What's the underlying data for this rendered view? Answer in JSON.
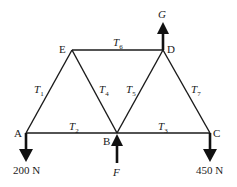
{
  "diagram": {
    "type": "truss",
    "nodes": {
      "A": {
        "label": "A"
      },
      "B": {
        "label": "B"
      },
      "C": {
        "label": "C"
      },
      "D": {
        "label": "D"
      },
      "E": {
        "label": "E"
      }
    },
    "members": [
      {
        "id": "T1",
        "symbol": "T",
        "sub": "1",
        "from": "A",
        "to": "E"
      },
      {
        "id": "T2",
        "symbol": "T",
        "sub": "2",
        "from": "A",
        "to": "B"
      },
      {
        "id": "T3",
        "symbol": "T",
        "sub": "3",
        "from": "B",
        "to": "C"
      },
      {
        "id": "T4",
        "symbol": "T",
        "sub": "4",
        "from": "E",
        "to": "B"
      },
      {
        "id": "T5",
        "symbol": "T",
        "sub": "5",
        "from": "B",
        "to": "D"
      },
      {
        "id": "T6",
        "symbol": "T",
        "sub": "6",
        "from": "E",
        "to": "D"
      },
      {
        "id": "T7",
        "symbol": "T",
        "sub": "7",
        "from": "D",
        "to": "C"
      }
    ],
    "forces": {
      "A": {
        "label": "200 N",
        "direction": "down"
      },
      "B": {
        "label": "F",
        "direction": "up"
      },
      "C": {
        "label": "450 N",
        "direction": "down"
      },
      "D": {
        "label": "G",
        "direction": "up"
      }
    }
  }
}
